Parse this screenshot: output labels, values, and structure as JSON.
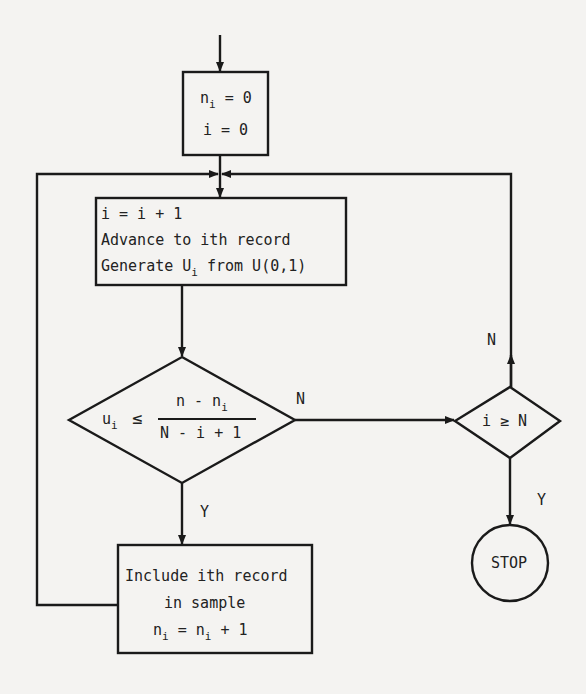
{
  "diagram": {
    "type": "flowchart",
    "nodes": {
      "init": {
        "line1_var": "n",
        "line1_sub": "i",
        "line1_rest": " = 0",
        "line2": "i = 0"
      },
      "process": {
        "line1": "i = i + 1",
        "line2": "Advance to ith record",
        "line3_pre": "Generate U",
        "line3_sub": "i",
        "line3_post": " from U(0,1)"
      },
      "decision1": {
        "lhs_var": "u",
        "lhs_sub": "i",
        "op": "≤",
        "numerator_pre": "n - n",
        "numerator_sub": "i",
        "denominator": "N - i + 1"
      },
      "decision2": {
        "text": "i ≥ N"
      },
      "include": {
        "line1": "Include ith record",
        "line2": "in sample",
        "line3_a": "n",
        "line3_a_sub": "i",
        "line3_mid": " = n",
        "line3_b_sub": "i",
        "line3_end": " + 1"
      },
      "stop": {
        "text": "STOP"
      }
    },
    "edge_labels": {
      "d1_no": "N",
      "d1_yes": "Y",
      "d2_no": "N",
      "d2_yes": "Y"
    },
    "colors": {
      "line": "#1a1a1a",
      "background": "#f4f3f1"
    }
  }
}
